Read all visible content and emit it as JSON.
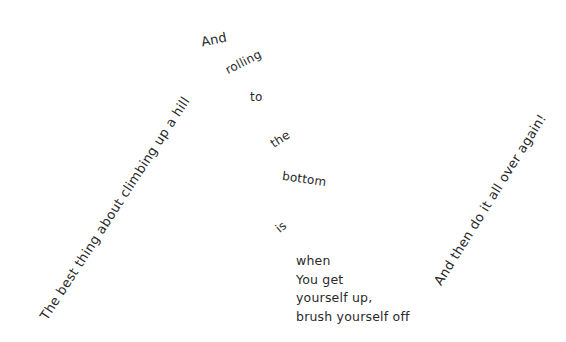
{
  "poem": {
    "left_line": "The best thing about climbing up a hill",
    "cascade": [
      "And",
      "rolling",
      "to",
      "the",
      "bottom",
      "is"
    ],
    "stanza": [
      "when",
      "You get",
      "yourself up,",
      "brush yourself off"
    ],
    "right_line": "And then do it all over again!"
  },
  "colors": {
    "background": "#ffffff",
    "text": "#2a2a2a"
  }
}
